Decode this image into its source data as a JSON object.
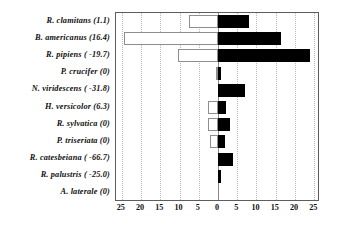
{
  "chart_data": {
    "type": "bar",
    "orientation": "horizontal",
    "subtype": "diverging-paired-bars",
    "title": "",
    "xlabel": "",
    "ylabel": "",
    "xlim": [
      -26.5,
      26.5
    ],
    "grid": true,
    "legend": null,
    "x_tick_values": [
      -25,
      -20,
      -15,
      -10,
      -5,
      0,
      5,
      10,
      15,
      20,
      25
    ],
    "x_tick_labels": [
      "25",
      "20",
      "15",
      "10",
      "5",
      "0",
      "5",
      "10",
      "15",
      "20",
      "25"
    ],
    "categories": [
      "R. clamitans (1.1)",
      "B. americanus (16.4)",
      "R. pipiens ( -19.7)",
      "P. crucifer (0)",
      "N. viridescens ( -31.8)",
      "H. versicolor (6.3)",
      "R. sylvatica (0)",
      "P. triseriata (0)",
      "R. catesbeiana ( -66.7)",
      "R. palustris ( -25.0)",
      "A. laterale (0)"
    ],
    "series": [
      {
        "name": "left-open-bars",
        "fill": "#ffffff",
        "edge": "#8e8e8e",
        "side": "left",
        "values": [
          7.5,
          24.5,
          10.5,
          0.6,
          0,
          2.5,
          2.5,
          2.2,
          0,
          0,
          0
        ]
      },
      {
        "name": "right-filled-bars",
        "fill": "#000000",
        "edge": "#000000",
        "side": "right",
        "values": [
          8.0,
          16.3,
          23.8,
          0.7,
          7.0,
          2.0,
          3.0,
          1.8,
          3.8,
          0.7,
          0
        ]
      }
    ]
  },
  "colors": {
    "frame": "#5d5d5d",
    "grid": "#b9b9b9",
    "zero_axis": "#8a8a8a",
    "text": "#111111",
    "bar_open_fill": "#ffffff",
    "bar_open_edge": "#8e8e8e",
    "bar_filled": "#000000",
    "background": "#ffffff"
  }
}
